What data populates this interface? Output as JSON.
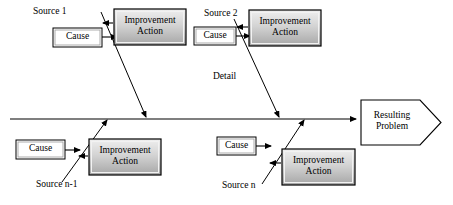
{
  "diagram": {
    "type": "fishbone-cause-and-effect",
    "title": "",
    "spine": {
      "label": "",
      "y": 119,
      "x_start": 10,
      "x_end": 360
    },
    "effect": {
      "label": "Resulting\nProblem",
      "shape": "pentagon-arrow",
      "x": 360,
      "y": 100,
      "width": 80,
      "height": 45
    },
    "branches": [
      {
        "id": "source-1",
        "source_label": "Source 1",
        "source_label_x": 33,
        "source_label_y": 7,
        "position": "top",
        "cause": {
          "label": "Cause",
          "x": 52,
          "y": 27,
          "width": 50,
          "height": 21
        },
        "improvement": {
          "label": "Improvement\nAction",
          "x": 113,
          "y": 8,
          "width": 73,
          "height": 37
        },
        "rib": {
          "x1": 101,
          "y1": 12,
          "x2": 146,
          "y2": 119
        }
      },
      {
        "id": "source-2",
        "source_label": "Source 2",
        "source_label_x": 205,
        "source_label_y": 8,
        "detail_label": "Detail",
        "detail_label_x": 213,
        "detail_label_y": 72,
        "position": "top",
        "cause": {
          "label": "Cause",
          "x": 193,
          "y": 26,
          "width": 43,
          "height": 21
        },
        "improvement": {
          "label": "Improvement\nAction",
          "x": 248,
          "y": 9,
          "width": 73,
          "height": 37
        },
        "rib": {
          "x1": 234,
          "y1": 19,
          "x2": 279,
          "y2": 119
        }
      },
      {
        "id": "source-n-1",
        "source_label": "Source n-1",
        "source_label_x": 36,
        "source_label_y": 180,
        "position": "bottom",
        "cause": {
          "label": "Cause",
          "x": 15,
          "y": 139,
          "width": 50,
          "height": 21
        },
        "improvement": {
          "label": "Improvement\nAction",
          "x": 88,
          "y": 138,
          "width": 73,
          "height": 37
        },
        "rib": {
          "x1": 62,
          "y1": 180,
          "x2": 106,
          "y2": 118
        }
      },
      {
        "id": "source-n",
        "source_label": "Source n",
        "source_label_x": 222,
        "source_label_y": 181,
        "position": "bottom",
        "cause": {
          "label": "Cause",
          "x": 216,
          "y": 136,
          "width": 40,
          "height": 20
        },
        "improvement": {
          "label": "Improvement\nAction",
          "x": 281,
          "y": 148,
          "width": 74,
          "height": 37
        },
        "rib": {
          "x1": 262,
          "y1": 182,
          "x2": 303,
          "y2": 118
        }
      }
    ],
    "colors": {
      "line": "#000000",
      "cause_box_fill": "#ffffff",
      "cause_box_border": "#000000",
      "improvement_fill_light": "#e8e8e8",
      "improvement_fill_dark": "#a8a8a8",
      "improvement_border": "#000000",
      "effect_fill": "#ffffff",
      "text": "#000000"
    }
  }
}
